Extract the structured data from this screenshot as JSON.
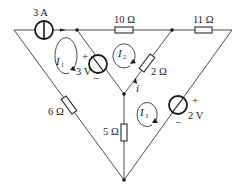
{
  "diagram": {
    "type": "circuit",
    "sources": {
      "current_3A": {
        "label": "3 A"
      },
      "voltage_3V": {
        "label": "3 V",
        "plus": "+",
        "minus": "−"
      },
      "voltage_2V": {
        "label": "2 V",
        "plus": "+",
        "minus": "−"
      }
    },
    "resistors": {
      "r10": {
        "label": "10 Ω"
      },
      "r11": {
        "label": "11 Ω"
      },
      "r2": {
        "label": "2 Ω"
      },
      "r6": {
        "label": "6 Ω"
      },
      "r5": {
        "label": "5 Ω"
      }
    },
    "loops": {
      "I1": {
        "symbol": "I",
        "sub": "1"
      },
      "I2": {
        "symbol": "I",
        "sub": "2"
      },
      "I3": {
        "symbol": "I",
        "sub": "3"
      }
    },
    "branch_current": {
      "label": "i"
    },
    "colors": {
      "line": "#3a3a3a",
      "background": "#ffffff"
    }
  }
}
